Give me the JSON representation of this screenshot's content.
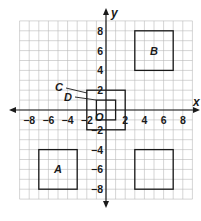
{
  "diagram": {
    "type": "coordinate-plane",
    "origin_label": "O",
    "x_axis": {
      "label": "x",
      "range": [
        -9,
        9
      ],
      "tick_labels": [
        {
          "value": -8,
          "text": "−8"
        },
        {
          "value": -6,
          "text": "−6"
        },
        {
          "value": -4,
          "text": "−4"
        },
        {
          "value": -2,
          "text": "−2"
        },
        {
          "value": 2,
          "text": "2"
        },
        {
          "value": 4,
          "text": "4"
        },
        {
          "value": 6,
          "text": "6"
        },
        {
          "value": 8,
          "text": "8"
        }
      ]
    },
    "y_axis": {
      "label": "y",
      "range": [
        -9,
        9
      ],
      "tick_labels": [
        {
          "value": 8,
          "text": "8"
        },
        {
          "value": 6,
          "text": "6"
        },
        {
          "value": 4,
          "text": "4"
        },
        {
          "value": 2,
          "text": "2"
        },
        {
          "value": -2,
          "text": "−2"
        },
        {
          "value": -4,
          "text": "−4"
        },
        {
          "value": -6,
          "text": "−6"
        },
        {
          "value": -8,
          "text": "−8"
        }
      ]
    },
    "squares": [
      {
        "name": "A",
        "label": "A",
        "x1": -7,
        "y1": -8,
        "x2": -3,
        "y2": -4,
        "label_inside": true
      },
      {
        "name": "B",
        "label": "B",
        "x1": 3,
        "y1": 4,
        "x2": 7,
        "y2": 8,
        "label_inside": true
      },
      {
        "name": "C",
        "label": "C",
        "x1": -2,
        "y1": -2,
        "x2": 2,
        "y2": 2,
        "label_inside": false
      },
      {
        "name": "D",
        "label": "D",
        "x1": -1,
        "y1": -1,
        "x2": 1,
        "y2": 1,
        "label_inside": false
      },
      {
        "name": "unlabeled",
        "label": "",
        "x1": 3,
        "y1": -8,
        "x2": 7,
        "y2": -4,
        "label_inside": false
      }
    ],
    "leader_labels": [
      {
        "label": "C",
        "text_x": 59,
        "text_y": 91,
        "line": [
          66,
          88,
          87,
          93
        ]
      },
      {
        "label": "D",
        "text_x": 68,
        "text_y": 101,
        "line": [
          75,
          97,
          96,
          100
        ]
      }
    ],
    "colors": {
      "grid": "#b9b9b9",
      "ink": "#1a1a1a",
      "background": "#ffffff"
    }
  }
}
